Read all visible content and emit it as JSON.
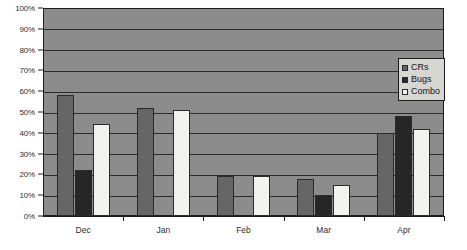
{
  "chart_data": {
    "type": "bar",
    "title": "",
    "subtitle": "",
    "xlabel": "",
    "ylabel": "",
    "categories": [
      "Dec",
      "Jan",
      "Feb",
      "Mar",
      "Apr"
    ],
    "series": [
      {
        "name": "CRs",
        "color": "#666666",
        "values": [
          58,
          52,
          19,
          18,
          40
        ]
      },
      {
        "name": "Bugs",
        "color": "#262626",
        "values": [
          22,
          0,
          0,
          10,
          48
        ]
      },
      {
        "name": "Combo",
        "color": "#f2f2ee",
        "values": [
          44,
          51,
          19,
          15,
          42
        ]
      }
    ],
    "ylim": [
      0,
      100
    ],
    "ytick_values": [
      0,
      10,
      20,
      30,
      40,
      50,
      60,
      70,
      80,
      90,
      100
    ],
    "ytick_labels": [
      "0%",
      "10%",
      "20%",
      "30%",
      "40%",
      "50%",
      "60%",
      "70%",
      "80%",
      "90%",
      "100%"
    ],
    "grid": true,
    "grid_axis": "y",
    "legend_position": "right-top",
    "plot_background": "#8c8c8c",
    "axis_color": "#1c1c1c",
    "gridline_color": "#2b2b2b"
  },
  "legend": {
    "items": [
      {
        "label": "CRs",
        "swatch": "#666666"
      },
      {
        "label": "Bugs",
        "swatch": "#262626"
      },
      {
        "label": "Combo",
        "swatch": "#f2f2ee"
      }
    ]
  }
}
